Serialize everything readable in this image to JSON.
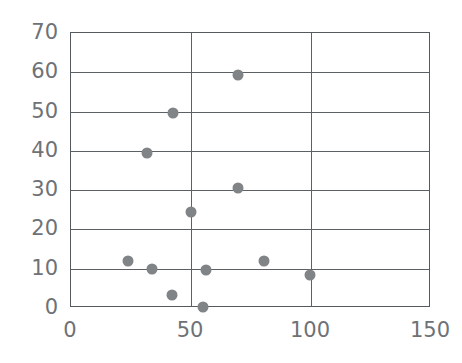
{
  "chart_data": {
    "type": "scatter",
    "title": "",
    "xlabel": "",
    "ylabel": "",
    "xlim": [
      0,
      150
    ],
    "ylim": [
      0,
      70
    ],
    "grid": true,
    "legend": false,
    "x_ticks": [
      0,
      50,
      100,
      150
    ],
    "x_tick_labels": [
      "0",
      "50",
      "100",
      "150"
    ],
    "y_ticks": [
      0,
      10,
      20,
      30,
      40,
      50,
      60,
      70
    ],
    "y_tick_labels": [
      "0",
      "10",
      "20",
      "30",
      "40",
      "50",
      "60",
      "70"
    ],
    "x_gridlines": [
      50,
      100
    ],
    "y_gridlines": [
      10,
      20,
      30,
      40,
      50,
      60
    ],
    "marker": "circle",
    "marker_color": "#808487",
    "axis_color": "#5c6165",
    "tick_label_color": "#6e7276",
    "points": [
      {
        "x": 24,
        "y": 11.7
      },
      {
        "x": 34,
        "y": 9.7
      },
      {
        "x": 32,
        "y": 39.2
      },
      {
        "x": 43,
        "y": 49.4
      },
      {
        "x": 42.5,
        "y": 3.0
      },
      {
        "x": 50.5,
        "y": 24.2
      },
      {
        "x": 55.5,
        "y": 0.0
      },
      {
        "x": 56.5,
        "y": 9.4
      },
      {
        "x": 70,
        "y": 59.1
      },
      {
        "x": 70,
        "y": 30.2
      },
      {
        "x": 81,
        "y": 11.7
      },
      {
        "x": 100,
        "y": 8.1
      }
    ]
  }
}
